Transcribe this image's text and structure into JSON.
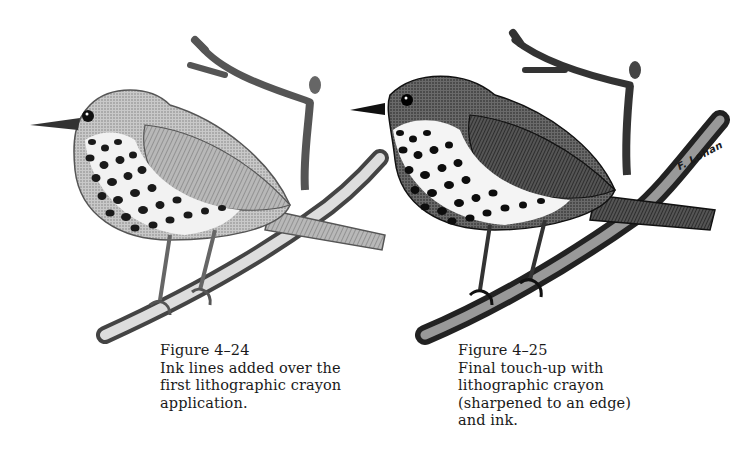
{
  "figures": [
    {
      "id": "figure-4-24",
      "title": "Figure 4–24",
      "caption": "Ink lines added over the first lithographic crayon application.",
      "caption_lines": [
        "Ink lines added over the",
        "first lithographic crayon",
        "application."
      ],
      "illustration": "thrush-on-branch-light",
      "tone": "#8a8a8a"
    },
    {
      "id": "figure-4-25",
      "title": "Figure 4–25",
      "caption": "Final touch-up with lithographic crayon (sharpened to an edge) and ink.",
      "caption_lines": [
        "Final touch-up with",
        "lithographic crayon",
        "(sharpened to an edge)",
        "and ink."
      ],
      "illustration": "thrush-on-branch-dark",
      "signature": "F. Lohan",
      "tone": "#3a3a3a"
    }
  ]
}
